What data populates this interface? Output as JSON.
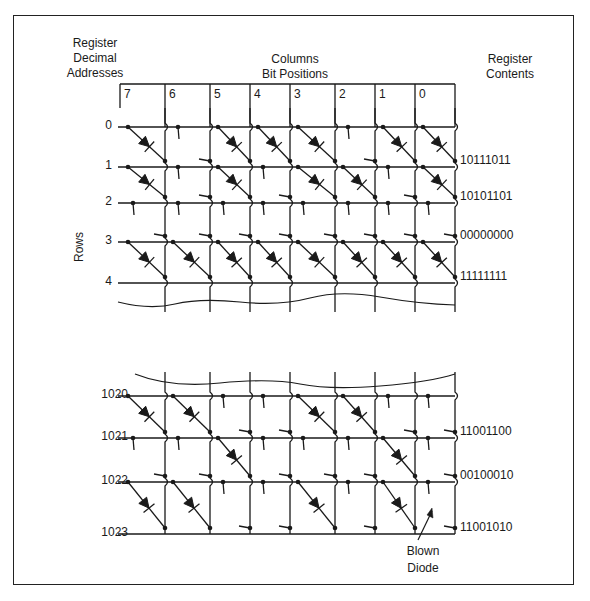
{
  "headers": {
    "left": [
      "Register",
      "Decimal",
      "Addresses"
    ],
    "middle": [
      "Columns",
      "Bit Positions"
    ],
    "right": [
      "Register",
      "Contents"
    ]
  },
  "axis_label_rows": "Rows",
  "columns": [
    "7",
    "6",
    "5",
    "4",
    "3",
    "2",
    "1",
    "0"
  ],
  "upper_block": {
    "row_addresses": [
      "0",
      "1",
      "2",
      "3",
      "4"
    ],
    "registers": [
      {
        "address": "0",
        "contents": "10111011"
      },
      {
        "address": "1",
        "contents": "10101101"
      },
      {
        "address": "2",
        "contents": "00000000"
      },
      {
        "address": "3",
        "contents": "11111111"
      }
    ]
  },
  "lower_block": {
    "row_addresses": [
      "1020",
      "1021",
      "1022",
      "1023"
    ],
    "registers": [
      {
        "address": "1020",
        "contents": "11001100"
      },
      {
        "address": "1021",
        "contents": "00100010"
      },
      {
        "address": "1022",
        "contents": "11001010"
      }
    ]
  },
  "annotation": {
    "line1": "Blown",
    "line2": "Diode"
  }
}
